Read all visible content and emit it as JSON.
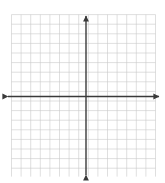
{
  "figure": {
    "name": "blank-coordinate-grid",
    "background_color": "#ffffff",
    "width": 165,
    "height": 183
  },
  "chart_data": {
    "type": "scatter",
    "title": "",
    "subtitle": "",
    "xlabel": "",
    "ylabel": "",
    "series": [
      {
        "name": "",
        "x": [],
        "y": []
      }
    ],
    "annotations": [],
    "legend": {
      "visible": false,
      "position": "none",
      "entries": []
    },
    "grid": {
      "visible": true,
      "color": "#c9c9c9",
      "minor_color": "#e2e2e2",
      "line_width": 0.6,
      "columns": 15,
      "rows": 16,
      "cell_size_px": 9.6,
      "left_px": 11.5,
      "top_px": 14.6,
      "right_px": 155.5,
      "bottom_px": 176.6
    },
    "axes": {
      "color": "#3a3a3a",
      "line_width": 1.4,
      "arrowheads": [
        "up",
        "down",
        "left",
        "right"
      ],
      "origin_px": {
        "x": 86.0,
        "y": 96.5
      },
      "x_axis": {
        "visible": true,
        "ticks": [],
        "tick_labels": [],
        "xlim": [
          -7.5,
          7.5
        ],
        "start_px": 8.0,
        "end_px": 159.0
      },
      "y_axis": {
        "visible": true,
        "ticks": [],
        "tick_labels": [],
        "ylim": [
          -8.5,
          8.5
        ],
        "start_px": 175.0,
        "end_px": 16.0
      }
    }
  }
}
